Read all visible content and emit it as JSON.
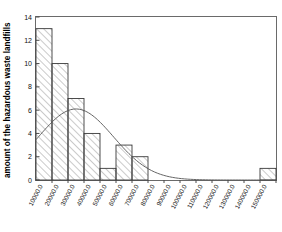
{
  "chart_data": {
    "type": "bar",
    "title": "",
    "subtitle": "",
    "xlabel": "",
    "ylabel": "amount of the hazardous waste landfills",
    "categories": [
      "10000.0",
      "20000.0",
      "30000.0",
      "40000.0",
      "50000.0",
      "60000.0",
      "70000.0",
      "80000.0",
      "90000.0",
      "100000.0",
      "110000.0",
      "120000.0",
      "130000.0",
      "140000.0",
      "150000.0"
    ],
    "values": [
      13,
      10,
      7,
      4,
      1,
      3,
      2,
      0,
      0,
      0,
      0,
      0,
      0,
      0,
      1
    ],
    "ylim": [
      0,
      14
    ],
    "yticks": [
      "0",
      "2",
      "4",
      "6",
      "8",
      "10",
      "12",
      "14"
    ],
    "ytick_values": [
      0,
      2,
      4,
      6,
      8,
      10,
      12,
      14
    ],
    "grid": false,
    "legend": "none",
    "bar_style": "hatched-diagonal",
    "overlay": {
      "name": "normal-density-curve",
      "type": "line",
      "description": "fitted normal distribution curve overlaid on histogram",
      "peak_value": 6.1,
      "peak_x": "30000.0"
    }
  },
  "axes": {
    "y_axis_title": "amount of the hazardous waste landfills",
    "x_axis_title": ""
  },
  "colors": {
    "bar_stroke": "#3a3a3a",
    "bar_fill": "#ffffff",
    "hatch": "#7a7a7a",
    "curve": "#555555",
    "axis": "#4a4a4a",
    "text": "#111111"
  }
}
